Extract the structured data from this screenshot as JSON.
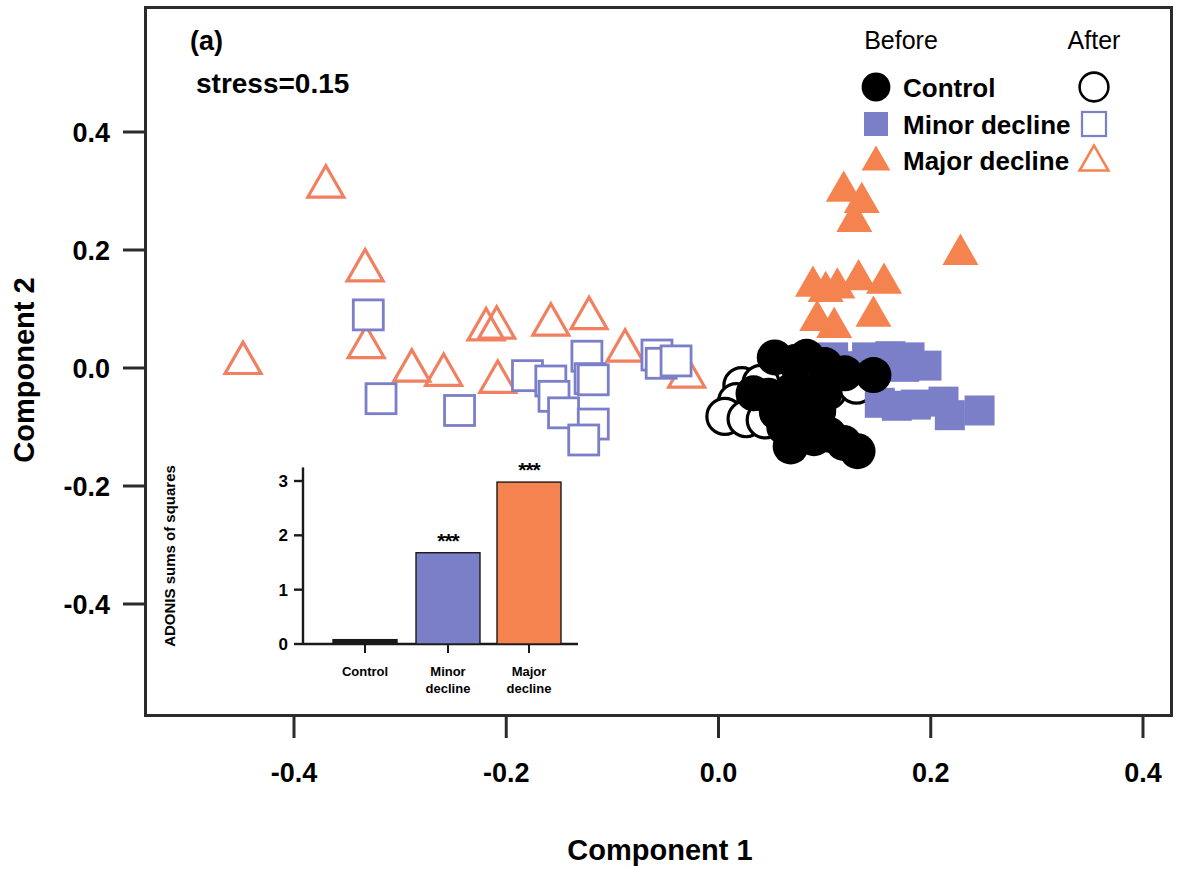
{
  "figure": {
    "panel_label": "(a)",
    "stress_label": "stress=0.15",
    "background_color": "#ffffff",
    "frame_color": "#2b2b2b"
  },
  "colors": {
    "control_fill": "#000000",
    "control_outline": "#000000",
    "minor_fill": "#7B7FC8",
    "minor_outline": "#7B7FC8",
    "major_fill": "#F5834F",
    "major_outline": "#F08060",
    "text": "#000000"
  },
  "legend": {
    "header_before": "Before",
    "header_after": "After",
    "items": [
      {
        "label": "Control",
        "before_symbol": "filled-circle",
        "after_symbol": "open-circle",
        "color": "#000000"
      },
      {
        "label": "Minor decline",
        "before_symbol": "filled-square",
        "after_symbol": "open-square",
        "color": "#7B7FC8"
      },
      {
        "label": "Major decline",
        "before_symbol": "filled-triangle",
        "after_symbol": "open-triangle",
        "color": "#F5834F"
      }
    ]
  },
  "chart_data": {
    "type": "scatter",
    "title": "",
    "subtitle": "stress=0.15",
    "xlabel": "Component 1",
    "ylabel": "Component 2",
    "xlim": [
      -0.52,
      0.47
    ],
    "ylim": [
      -0.47,
      0.48
    ],
    "xticks": [
      -0.4,
      -0.2,
      0.0,
      0.2,
      0.4
    ],
    "xticklabels": [
      "-0.4",
      "-0.2",
      "0.0",
      "0.2",
      "0.4"
    ],
    "yticks": [
      -0.4,
      -0.2,
      0.0,
      0.2,
      0.4
    ],
    "yticklabels": [
      "-0.4",
      "-0.2",
      "0.0",
      "0.2",
      "0.4"
    ],
    "grid": false,
    "legend_position": "top-right",
    "series": [
      {
        "name": "Control before",
        "marker": "filled-circle",
        "color": "#000000",
        "filled": true,
        "points": [
          [
            0.053,
            0.018
          ],
          [
            0.072,
            0.01
          ],
          [
            0.083,
            0.019
          ],
          [
            0.1,
            0.005
          ],
          [
            0.119,
            -0.009
          ],
          [
            0.146,
            -0.012
          ],
          [
            0.033,
            -0.043
          ],
          [
            0.047,
            -0.047
          ],
          [
            0.06,
            -0.052
          ],
          [
            0.07,
            -0.037
          ],
          [
            0.084,
            -0.041
          ],
          [
            0.1,
            -0.042
          ],
          [
            0.055,
            -0.075
          ],
          [
            0.078,
            -0.077
          ],
          [
            0.094,
            -0.073
          ],
          [
            0.062,
            -0.1
          ],
          [
            0.077,
            -0.106
          ],
          [
            0.09,
            -0.119
          ],
          [
            0.104,
            -0.113
          ],
          [
            0.118,
            -0.127
          ],
          [
            0.068,
            -0.133
          ],
          [
            0.131,
            -0.141
          ]
        ]
      },
      {
        "name": "Control after",
        "marker": "open-circle",
        "color": "#000000",
        "filled": false,
        "points": [
          [
            0.022,
            -0.03
          ],
          [
            0.04,
            -0.026
          ],
          [
            0.093,
            -0.012
          ],
          [
            0.11,
            -0.021
          ],
          [
            0.103,
            -0.039
          ],
          [
            0.017,
            -0.057
          ],
          [
            0.035,
            -0.06
          ],
          [
            0.053,
            -0.058
          ],
          [
            0.072,
            -0.065
          ],
          [
            0.006,
            -0.082
          ],
          [
            0.026,
            -0.086
          ],
          [
            0.044,
            -0.088
          ],
          [
            0.13,
            -0.029
          ]
        ]
      },
      {
        "name": "Minor decline before",
        "marker": "filled-square",
        "color": "#7B7FC8",
        "filled": true,
        "points": [
          [
            0.108,
            0.018
          ],
          [
            0.14,
            0.018
          ],
          [
            0.162,
            0.02
          ],
          [
            0.18,
            0.018
          ],
          [
            0.127,
            0.003
          ],
          [
            0.175,
            0.002
          ],
          [
            0.196,
            0.004
          ],
          [
            0.152,
            -0.059
          ],
          [
            0.168,
            -0.064
          ],
          [
            0.186,
            -0.062
          ],
          [
            0.212,
            -0.057
          ],
          [
            0.218,
            -0.08
          ],
          [
            0.246,
            -0.072
          ]
        ]
      },
      {
        "name": "Minor decline after",
        "marker": "open-square",
        "color": "#7B7FC8",
        "filled": false,
        "points": [
          [
            -0.33,
            0.09
          ],
          [
            -0.318,
            -0.052
          ],
          [
            -0.244,
            -0.072
          ],
          [
            -0.18,
            -0.013
          ],
          [
            -0.158,
            -0.022
          ],
          [
            -0.155,
            -0.048
          ],
          [
            -0.146,
            -0.076
          ],
          [
            -0.124,
            0.02
          ],
          [
            -0.121,
            -0.018
          ],
          [
            -0.118,
            -0.02
          ],
          [
            -0.118,
            -0.095
          ],
          [
            -0.127,
            -0.122
          ],
          [
            -0.058,
            0.022
          ],
          [
            -0.054,
            0.008
          ],
          [
            -0.04,
            0.012
          ]
        ]
      },
      {
        "name": "Major decline before",
        "marker": "filled-triangle",
        "color": "#F5834F",
        "filled": true,
        "points": [
          [
            0.118,
            0.304
          ],
          [
            0.135,
            0.285
          ],
          [
            0.128,
            0.253
          ],
          [
            0.228,
            0.197
          ],
          [
            0.089,
            0.143
          ],
          [
            0.101,
            0.134
          ],
          [
            0.112,
            0.14
          ],
          [
            0.132,
            0.154
          ],
          [
            0.156,
            0.148
          ],
          [
            0.093,
            0.085
          ],
          [
            0.109,
            0.073
          ],
          [
            0.146,
            0.092
          ],
          [
            0.153,
            0.006
          ]
        ]
      },
      {
        "name": "Major decline after",
        "marker": "open-triangle",
        "color": "#F08060",
        "filled": false,
        "points": [
          [
            -0.37,
            0.312
          ],
          [
            -0.448,
            0.013
          ],
          [
            -0.333,
            0.17
          ],
          [
            -0.332,
            0.04
          ],
          [
            -0.289,
            0.0
          ],
          [
            -0.259,
            -0.007
          ],
          [
            -0.219,
            0.07
          ],
          [
            -0.209,
            0.073
          ],
          [
            -0.208,
            -0.019
          ],
          [
            -0.158,
            0.078
          ],
          [
            -0.122,
            0.089
          ],
          [
            -0.088,
            0.034
          ],
          [
            -0.03,
            -0.01
          ],
          [
            0.075,
            -0.022
          ]
        ]
      }
    ]
  },
  "inset_chart": {
    "type": "bar",
    "ylabel": "ADONIS sums of squares",
    "categories": [
      "Control",
      "Minor\ndecline",
      "Major\ndecline"
    ],
    "category_lines": [
      [
        "Control"
      ],
      [
        "Minor",
        "decline"
      ],
      [
        "Major",
        "decline"
      ]
    ],
    "values": [
      0.08,
      1.68,
      2.98
    ],
    "colors": [
      "#1a1a1a",
      "#7B7FC8",
      "#F5834F"
    ],
    "yticks": [
      0,
      1,
      2,
      3
    ],
    "yticklabels": [
      "0",
      "1",
      "2",
      "3"
    ],
    "ylim": [
      0,
      3.3
    ],
    "significance": [
      "",
      "***",
      "***"
    ],
    "grid": false
  }
}
